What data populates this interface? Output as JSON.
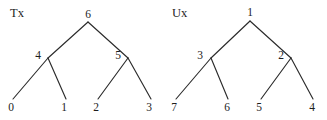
{
  "figure": {
    "width": 327,
    "height": 120,
    "background": "#ffffff",
    "stroke_color": "#2b2b2b",
    "text_color": "#1d1d1d"
  },
  "trees": [
    {
      "title": "Tx",
      "title_x": 10,
      "title_y": 14,
      "nodes": [
        {
          "label": "6",
          "role": "root",
          "x": 88,
          "y": 15,
          "vx": 88,
          "vy": 22
        },
        {
          "label": "4",
          "role": "internal",
          "x": 38,
          "y": 56,
          "vx": 48,
          "vy": 58
        },
        {
          "label": "5",
          "role": "internal",
          "x": 118,
          "y": 56,
          "vx": 128,
          "vy": 58
        },
        {
          "label": "0",
          "role": "leaf",
          "x": 11,
          "y": 108,
          "vx": 13,
          "vy": 99
        },
        {
          "label": "1",
          "role": "leaf",
          "x": 64,
          "y": 108,
          "vx": 66,
          "vy": 99
        },
        {
          "label": "2",
          "role": "leaf",
          "x": 96,
          "y": 108,
          "vx": 98,
          "vy": 99
        },
        {
          "label": "3",
          "role": "leaf",
          "x": 149,
          "y": 108,
          "vx": 151,
          "vy": 99
        }
      ],
      "edges": [
        {
          "from": 0,
          "to": 1
        },
        {
          "from": 0,
          "to": 2
        },
        {
          "from": 1,
          "to": 3
        },
        {
          "from": 1,
          "to": 4
        },
        {
          "from": 2,
          "to": 5
        },
        {
          "from": 2,
          "to": 6
        }
      ]
    },
    {
      "title": "Ux",
      "title_x": 172,
      "title_y": 14,
      "nodes": [
        {
          "label": "1",
          "role": "root",
          "x": 250,
          "y": 13,
          "vx": 250,
          "vy": 21
        },
        {
          "label": "3",
          "role": "internal",
          "x": 200,
          "y": 56,
          "vx": 211,
          "vy": 58
        },
        {
          "label": "2",
          "role": "internal",
          "x": 281,
          "y": 56,
          "vx": 291,
          "vy": 58
        },
        {
          "label": "7",
          "role": "leaf",
          "x": 174,
          "y": 108,
          "vx": 176,
          "vy": 99
        },
        {
          "label": "6",
          "role": "leaf",
          "x": 227,
          "y": 108,
          "vx": 228,
          "vy": 99
        },
        {
          "label": "5",
          "role": "leaf",
          "x": 259,
          "y": 108,
          "vx": 261,
          "vy": 99
        },
        {
          "label": "4",
          "role": "leaf",
          "x": 312,
          "y": 108,
          "vx": 313,
          "vy": 99
        }
      ],
      "edges": [
        {
          "from": 0,
          "to": 1
        },
        {
          "from": 0,
          "to": 2
        },
        {
          "from": 1,
          "to": 3
        },
        {
          "from": 1,
          "to": 4
        },
        {
          "from": 2,
          "to": 5
        },
        {
          "from": 2,
          "to": 6
        }
      ]
    }
  ]
}
